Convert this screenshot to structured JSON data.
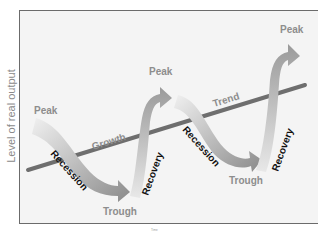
{
  "axis": {
    "y_label": "Level of real output",
    "footnote": "Time"
  },
  "labels": {
    "peak1": "Peak",
    "peak2": "Peak",
    "peak3": "Peak",
    "trough1": "Trough",
    "trough2": "Trough",
    "recession1": "Recession",
    "recession2": "Recession",
    "recovery1": "Recovery",
    "recovery2": "Recovery",
    "growth": "Growth",
    "trend": "Trend"
  },
  "colors": {
    "background": "#f4f4f4",
    "frame": "#6b6b6b",
    "trend_line": "#6e6e6e",
    "arrow_light": "#e6e6e6",
    "arrow_dark": "#8c8c8c",
    "gray_text": "#8d8d8d",
    "black_text": "#111111"
  }
}
